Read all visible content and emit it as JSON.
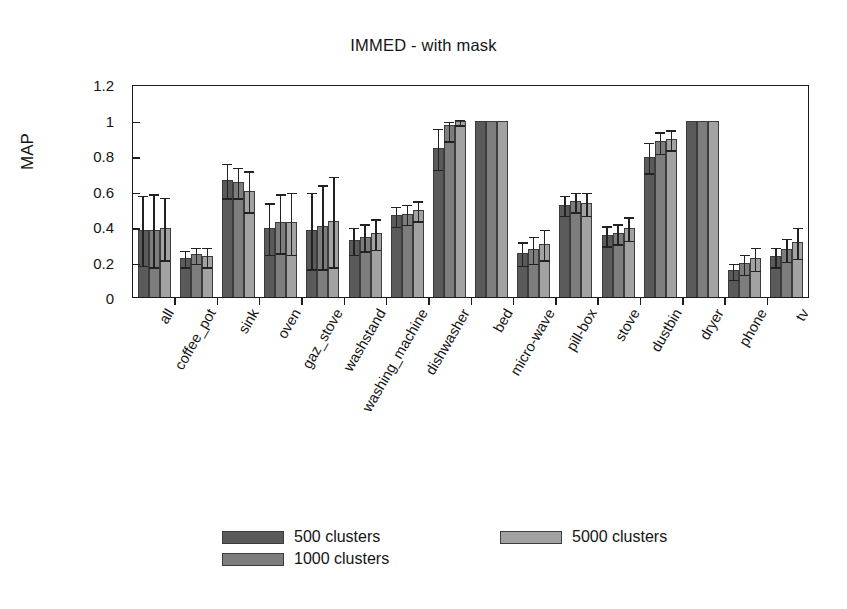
{
  "chart_data": {
    "type": "bar",
    "title": "IMMED - with mask",
    "xlabel": "",
    "ylabel": "MAP",
    "ylim": [
      0,
      1.2
    ],
    "yticks": [
      "0",
      "0.2",
      "0.4",
      "0.6",
      "0.8",
      "1",
      "1.2"
    ],
    "ytick_values": [
      0,
      0.2,
      0.4,
      0.6,
      0.8,
      1.0,
      1.2
    ],
    "grid": false,
    "legend_position": "below-plot",
    "error_bars": "standard deviation",
    "categories": [
      "all",
      "coffee_pot",
      "sink",
      "oven",
      "gaz_stove",
      "washstand",
      "washing_machine",
      "dishwasher",
      "bed",
      "micro-wave",
      "pill-box",
      "stove",
      "dustbin",
      "dryer",
      "phone",
      "tv"
    ],
    "series": [
      {
        "name": "500 clusters",
        "color": "#5a5a5a",
        "values": [
          0.38,
          0.22,
          0.66,
          0.39,
          0.38,
          0.32,
          0.46,
          0.84,
          0.99,
          0.25,
          0.52,
          0.35,
          0.79,
          0.99,
          0.15,
          0.23
        ],
        "err_low": [
          0.2,
          0.05,
          0.1,
          0.15,
          0.22,
          0.08,
          0.06,
          0.12,
          0.0,
          0.07,
          0.06,
          0.06,
          0.09,
          0.0,
          0.05,
          0.06
        ],
        "err_high": [
          0.2,
          0.05,
          0.1,
          0.15,
          0.22,
          0.08,
          0.06,
          0.12,
          0.0,
          0.07,
          0.06,
          0.06,
          0.09,
          0.0,
          0.05,
          0.06
        ]
      },
      {
        "name": "1000 clusters",
        "color": "#7d7d7d",
        "values": [
          0.38,
          0.24,
          0.65,
          0.42,
          0.4,
          0.34,
          0.47,
          0.97,
          0.99,
          0.27,
          0.54,
          0.36,
          0.88,
          0.99,
          0.19,
          0.27
        ],
        "err_low": [
          0.21,
          0.05,
          0.09,
          0.17,
          0.24,
          0.08,
          0.06,
          0.09,
          0.0,
          0.08,
          0.06,
          0.06,
          0.07,
          0.0,
          0.06,
          0.07
        ],
        "err_high": [
          0.21,
          0.05,
          0.09,
          0.17,
          0.24,
          0.08,
          0.06,
          0.03,
          0.0,
          0.08,
          0.06,
          0.06,
          0.06,
          0.0,
          0.06,
          0.07
        ]
      },
      {
        "name": "5000 clusters",
        "color": "#a2a2a2",
        "values": [
          0.39,
          0.23,
          0.6,
          0.42,
          0.43,
          0.36,
          0.49,
          0.99,
          0.99,
          0.3,
          0.53,
          0.39,
          0.89,
          0.99,
          0.22,
          0.31
        ],
        "err_low": [
          0.18,
          0.06,
          0.12,
          0.18,
          0.26,
          0.09,
          0.06,
          0.02,
          0.0,
          0.09,
          0.07,
          0.07,
          0.06,
          0.0,
          0.07,
          0.09
        ],
        "err_high": [
          0.18,
          0.06,
          0.12,
          0.18,
          0.26,
          0.09,
          0.06,
          0.02,
          0.0,
          0.09,
          0.07,
          0.07,
          0.06,
          0.0,
          0.07,
          0.09
        ]
      }
    ]
  },
  "legend": {
    "entries": [
      {
        "label": "500 clusters"
      },
      {
        "label": "1000 clusters"
      },
      {
        "label": "5000 clusters"
      }
    ]
  }
}
